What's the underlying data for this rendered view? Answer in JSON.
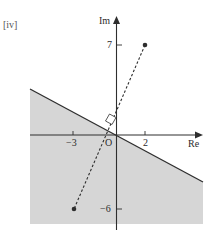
{
  "figure": {
    "panel_label": "[iv]",
    "axes": {
      "x_label": "Re",
      "y_label": "Im",
      "origin_label": "O",
      "x_ticks": [
        {
          "value": -3,
          "label": "−3"
        },
        {
          "value": 2,
          "label": "2"
        }
      ],
      "y_ticks": [
        {
          "value": 7,
          "label": "7"
        },
        {
          "value": -6,
          "label": "−6"
        }
      ]
    },
    "points": [
      {
        "name": "A",
        "x": 2,
        "y": 7
      },
      {
        "name": "B",
        "x": -3,
        "y": -6
      }
    ],
    "segment": {
      "from": "A",
      "to": "B",
      "style": "dashed"
    },
    "boundary": {
      "type": "perpendicular bisector of AB",
      "right_angle_marker": true
    },
    "shaded_region": "side of the bisector containing B (-3, -6)",
    "colors": {
      "shade": "#d6d6d6",
      "line": "#2e2e2e",
      "text": "#2b2b2b"
    }
  }
}
